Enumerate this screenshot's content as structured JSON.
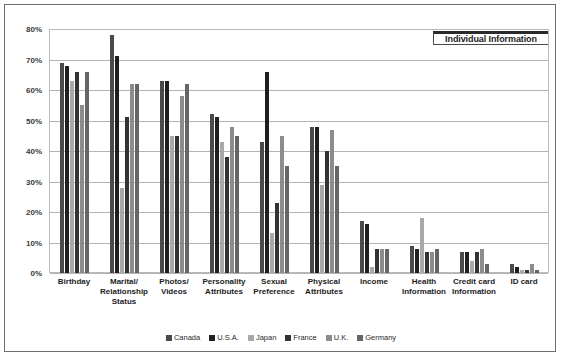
{
  "chart_data": {
    "type": "bar",
    "title": "Individual Information",
    "xlabel": "",
    "ylabel": "",
    "ylim": [
      0,
      80
    ],
    "ytick_labels": [
      "80%",
      "70%",
      "60%",
      "50%",
      "40%",
      "30%",
      "20%",
      "10%",
      "0%"
    ],
    "ytick_values": [
      80,
      70,
      60,
      50,
      40,
      30,
      20,
      10,
      0
    ],
    "grid": true,
    "legend_position": "bottom-center",
    "categories": [
      "Birthday",
      "Marital/ Relationship Status",
      "Photos/ Videos",
      "Personality Attributes",
      "Sexual Preference",
      "Physical Attributes",
      "Income",
      "Health Information",
      "Credit card Information",
      "ID card"
    ],
    "category_lines": [
      [
        "Birthday"
      ],
      [
        "Marital/",
        "Relationship",
        "Status"
      ],
      [
        "Photos/",
        "Videos"
      ],
      [
        "Personality",
        "Attributes"
      ],
      [
        "Sexual",
        "Preference"
      ],
      [
        "Physical",
        "Attributes"
      ],
      [
        "Income"
      ],
      [
        "Health",
        "Information"
      ],
      [
        "Credit card",
        "Information"
      ],
      [
        "ID card"
      ]
    ],
    "series": [
      {
        "name": "Canada",
        "color": "#4a4a4a",
        "values": [
          69,
          78,
          63,
          52,
          43,
          48,
          17,
          9,
          7,
          3
        ]
      },
      {
        "name": "U.S.A.",
        "color": "#1f1f1f",
        "values": [
          68,
          71,
          63,
          51,
          66,
          48,
          16,
          8,
          7,
          2
        ]
      },
      {
        "name": "Japan",
        "color": "#a8a8a8",
        "values": [
          63,
          28,
          45,
          43,
          13,
          29,
          2,
          18,
          4,
          1
        ]
      },
      {
        "name": "France",
        "color": "#333333",
        "values": [
          66,
          51,
          45,
          38,
          23,
          40,
          8,
          7,
          7,
          1
        ]
      },
      {
        "name": "U.K.",
        "color": "#8c8c8c",
        "values": [
          55,
          62,
          58,
          48,
          45,
          47,
          8,
          7,
          8,
          3
        ]
      },
      {
        "name": "Germany",
        "color": "#666666",
        "values": [
          66,
          62,
          62,
          45,
          35,
          35,
          8,
          8,
          3,
          1
        ]
      }
    ]
  },
  "legend": {
    "items": [
      {
        "label": "Canada"
      },
      {
        "label": "U.S.A."
      },
      {
        "label": "Japan"
      },
      {
        "label": "France"
      },
      {
        "label": "U.K."
      },
      {
        "label": "Germany"
      }
    ]
  },
  "colors": {
    "frame_border": "#6f6f6f",
    "plot_border": "#b9b9b9",
    "gridline": "#b4b4b4",
    "text": "#1c1c1c",
    "background": "#ffffff"
  }
}
